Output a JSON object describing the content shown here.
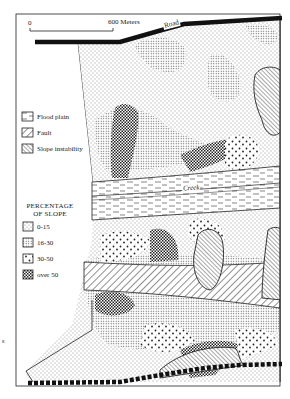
{
  "scale_bar": {
    "start_label": "0",
    "end_label": "600 Meters"
  },
  "features": {
    "road_label": "Road",
    "creek_label": "Creek"
  },
  "legend_features": {
    "items": [
      {
        "label": "Flood plain",
        "pattern": "flood-plain-dashes"
      },
      {
        "label": "Fault",
        "pattern": "fault-diagonal-hatch"
      },
      {
        "label": "Slope instability",
        "pattern": "slope-instability-fine-hatch"
      }
    ]
  },
  "legend_slope": {
    "title_line1": "PERCENTAGE",
    "title_line2": "OF SLOPE",
    "items": [
      {
        "label": "0-15",
        "pattern": "sparse-dots"
      },
      {
        "label": "16-30",
        "pattern": "fine-dense-dots"
      },
      {
        "label": "30-50",
        "pattern": "large-scattered-dots"
      },
      {
        "label": "over 50",
        "pattern": "dark-checker-dots"
      }
    ]
  },
  "margin_mark": "s",
  "colors": {
    "ink": "#1a1a1a",
    "paper": "#ffffff"
  }
}
